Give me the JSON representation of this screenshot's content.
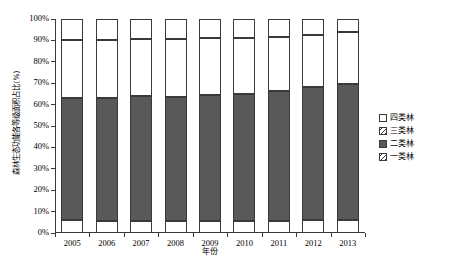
{
  "chart_data": {
    "type": "bar",
    "stacked": true,
    "stack_mode": "percent",
    "title": "",
    "xlabel": "年份",
    "ylabel": "森林生态功能各等级面积占比(%)",
    "categories": [
      "2005",
      "2006",
      "2007",
      "2008",
      "2009",
      "2010",
      "2011",
      "2012",
      "2013"
    ],
    "ylim": [
      0,
      100
    ],
    "ytick_labels": [
      "0%",
      "10%",
      "20%",
      "30%",
      "40%",
      "50%",
      "60%",
      "70%",
      "80%",
      "90%",
      "100%"
    ],
    "ytick_values": [
      0,
      10,
      20,
      30,
      40,
      50,
      60,
      70,
      80,
      90,
      100
    ],
    "grid": false,
    "legend_position": "right",
    "series": [
      {
        "name": "四类林",
        "fill": "white",
        "values": [
          10.0,
          10.0,
          9.5,
          9.5,
          9.0,
          9.0,
          8.5,
          7.5,
          6.0
        ]
      },
      {
        "name": "三类林",
        "fill": "diagonal-hatch",
        "values": [
          27.0,
          27.0,
          26.5,
          27.0,
          26.5,
          26.0,
          25.0,
          24.5,
          24.5
        ]
      },
      {
        "name": "二类林",
        "fill": "solid-gray",
        "values": [
          57.0,
          57.5,
          58.5,
          58.0,
          59.0,
          59.5,
          61.0,
          62.0,
          63.5
        ]
      },
      {
        "name": "一类林",
        "fill": "diagonal-hatch",
        "values": [
          6.0,
          5.5,
          5.5,
          5.5,
          5.5,
          5.5,
          5.5,
          6.0,
          6.0
        ]
      }
    ],
    "cumulative_tops": {
      "一类林": [
        6.0,
        5.5,
        5.5,
        5.5,
        5.5,
        5.5,
        5.5,
        6.0,
        6.0
      ],
      "二类林": [
        63.0,
        63.0,
        64.0,
        63.5,
        64.5,
        65.0,
        66.5,
        68.0,
        69.5
      ],
      "三类林": [
        90.0,
        90.0,
        90.5,
        90.5,
        91.0,
        91.0,
        91.5,
        92.5,
        94.0
      ],
      "四类林": [
        100,
        100,
        100,
        100,
        100,
        100,
        100,
        100,
        100
      ]
    },
    "colors": {
      "axis": "#3a3a3a",
      "gray_fill": "#595959",
      "hatch_line": "#3a3a3a",
      "background": "#ffffff"
    }
  },
  "legend": {
    "items": [
      {
        "label": "四类林",
        "swatch": "white-square"
      },
      {
        "label": "三类林",
        "swatch": "hatch-square"
      },
      {
        "label": "二类林",
        "swatch": "gray-square"
      },
      {
        "label": "一类林",
        "swatch": "hatch-square"
      }
    ]
  }
}
